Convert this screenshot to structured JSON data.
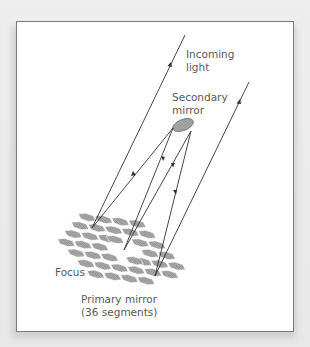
{
  "figure": {
    "labels": {
      "incoming_light_1": "Incoming",
      "incoming_light_2": "light",
      "secondary_mirror_1": "Secondary",
      "secondary_mirror_2": "mirror",
      "focus": "Focus",
      "primary_mirror_1": "Primary mirror",
      "primary_mirror_2": "(36 segments)"
    },
    "colors": {
      "panel_bg": "#ffffff",
      "panel_border": "#7a7a7a",
      "ray": "#333333",
      "mirror_fill": "#a8a8a8",
      "mirror_stroke": "#6e6e6e",
      "label_text": "#5a5a5a"
    },
    "primary_mirror_segments": 36
  }
}
